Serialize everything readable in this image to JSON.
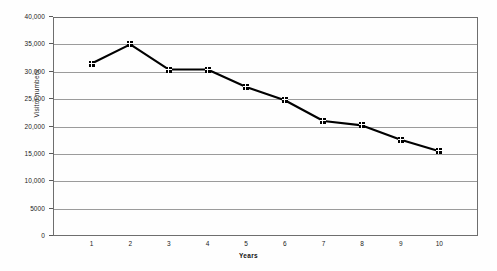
{
  "chart_data": {
    "type": "line",
    "title": "",
    "xlabel": "Years",
    "ylabel": "Visitor numbers",
    "x": [
      1,
      2,
      3,
      4,
      5,
      6,
      7,
      8,
      9,
      10
    ],
    "categories": [
      "1",
      "2",
      "3",
      "4",
      "5",
      "6",
      "7",
      "8",
      "9",
      "10"
    ],
    "values": [
      31500,
      35000,
      30400,
      30400,
      27200,
      24800,
      21000,
      20200,
      17600,
      15500
    ],
    "series": [
      {
        "name": "Visitor numbers",
        "values": [
          31500,
          35000,
          30400,
          30400,
          27200,
          24800,
          21000,
          20200,
          17600,
          15500
        ]
      }
    ],
    "ylim": [
      0,
      40000
    ],
    "xlim": [
      0.5,
      10.5
    ],
    "ytick_values": [
      0,
      5000,
      10000,
      15000,
      20000,
      25000,
      30000,
      35000,
      40000
    ],
    "ytick_labels": [
      "0",
      "5000",
      "10,000",
      "15,000",
      "20,000",
      "25,000",
      "30,000",
      "35,000",
      "40,000"
    ],
    "xtick_labels": [
      "1",
      "2",
      "3",
      "4",
      "5",
      "6",
      "7",
      "8",
      "9",
      "10"
    ],
    "grid": "horizontal",
    "legend": "none",
    "marker": "square",
    "line_color": "#000000",
    "grid_color": "#9b9b9b",
    "frame_color": "#6e6e6e",
    "background": "#ffffff"
  }
}
